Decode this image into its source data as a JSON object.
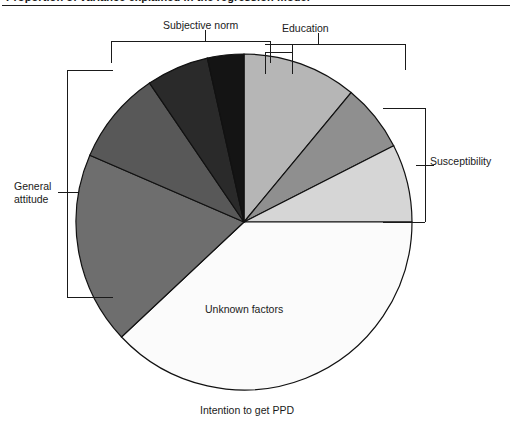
{
  "figure": {
    "caption": "Proportion of variance explained in the regression model",
    "rule_color": "#1a1a1a"
  },
  "labels": {
    "subjective_norm": "Subjective norm",
    "education": "Education",
    "general_attitude": "General attitude",
    "susceptibility": "Susceptibility",
    "unknown_factors": "Unknown factors",
    "intention": "Intention to get PPD"
  },
  "chart_data": {
    "type": "pie",
    "title": "Intention to get PPD",
    "xlabel": "",
    "ylabel": "",
    "grid": false,
    "legend_position": "none",
    "center": [
      244,
      222
    ],
    "radius": 168,
    "start_angle_deg": -90,
    "direction": "clockwise",
    "categories": [
      "Education",
      "Susceptibility",
      "Susceptibility (lower)",
      "Unknown factors",
      "General attitude",
      "Subjective norm (dark)",
      "Subjective norm (mid)",
      "Subjective norm (black)"
    ],
    "values": [
      11.0,
      6.5,
      7.5,
      38.0,
      18.5,
      9.0,
      6.0,
      3.5
    ],
    "colors": [
      "#b6b6b6",
      "#8f8f8f",
      "#d6d6d6",
      "#fbfbfb",
      "#6e6e6e",
      "#585858",
      "#2a2a2a",
      "#141414"
    ],
    "slice_labels": [
      "Education",
      "Susceptibility",
      "Susceptibility",
      "Unknown factors",
      "General attitude",
      "Subjective norm",
      "Subjective norm",
      "Subjective norm"
    ],
    "stroke": "#111111",
    "stroke_width": 1.2
  },
  "brackets": {
    "subjective_norm": {
      "x1": 111,
      "x2": 270,
      "y": 41,
      "tick_x": 205,
      "tick_top": 30
    },
    "education": {
      "x1": 265,
      "x2": 405,
      "y": 44,
      "tick_x": 318,
      "tick_top": 33,
      "inner_x1": 265,
      "inner_x2": 292,
      "inner_y": 52
    },
    "general_attitude": {
      "x": 67,
      "y1": 70,
      "y2": 297,
      "tick_y": 192,
      "tick_x1": 58,
      "tick_x2": 78
    },
    "susceptibility": {
      "x": 425,
      "y1": 108,
      "y2": 222,
      "tick_y": 165,
      "tick_x1": 416,
      "tick_x2": 434
    }
  }
}
